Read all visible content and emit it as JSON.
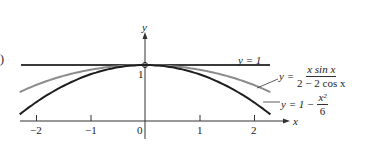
{
  "figure": {
    "panel_label": ")",
    "y_axis_label": "y",
    "x_axis_label": "x",
    "y_tick_label": "1",
    "x_ticks": [
      "−2",
      "−1",
      "0",
      "1",
      "2"
    ],
    "legend": {
      "line1": "y = 1",
      "line2_prefix": "y =",
      "line2_num": "x sin x",
      "line2_den": "2 − 2 cos x",
      "line3_prefix": "y = 1 −",
      "line3_num": "x²",
      "line3_den": "6"
    }
  },
  "chart_data": {
    "type": "line",
    "title": "",
    "xlabel": "x",
    "ylabel": "y",
    "xlim": [
      -2.3,
      2.3
    ],
    "ylim": [
      0,
      1.4
    ],
    "x_ticks": [
      -2,
      -1,
      0,
      1,
      2
    ],
    "y_ticks": [
      1
    ],
    "grid": false,
    "series": [
      {
        "name": "y = 1",
        "color": "#333333",
        "x": [
          -2.3,
          0,
          2.3
        ],
        "values": [
          1,
          1,
          1
        ]
      },
      {
        "name": "y = x sin x / (2 − 2 cos x)",
        "color": "#8a8a8a",
        "x": [
          -2.3,
          -2,
          -1.5,
          -1,
          -0.5,
          0,
          0.5,
          1,
          1.5,
          2,
          2.3
        ],
        "values": [
          0.515,
          0.604,
          0.766,
          0.915,
          0.979,
          1.0,
          0.979,
          0.915,
          0.766,
          0.604,
          0.515
        ]
      },
      {
        "name": "y = 1 − x²/6",
        "color": "#1a1a1a",
        "x": [
          -2.3,
          -2,
          -1.5,
          -1,
          -0.5,
          0,
          0.5,
          1,
          1.5,
          2,
          2.3
        ],
        "values": [
          0.118,
          0.333,
          0.625,
          0.833,
          0.958,
          1.0,
          0.958,
          0.833,
          0.625,
          0.333,
          0.118
        ]
      }
    ],
    "annotations": [
      "y = 1",
      "y = x sin x / (2 − 2 cos x)",
      "y = 1 − x²/6",
      "intersection point at (0, 1)"
    ]
  }
}
